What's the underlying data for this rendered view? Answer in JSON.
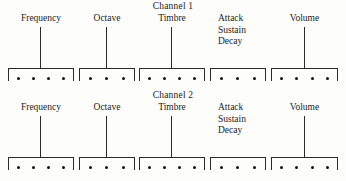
{
  "figure": {
    "background_color": "#fdfdfc",
    "ink_color": "#1c1c1c"
  },
  "channels": [
    {
      "title": "Channel 1",
      "groups": [
        {
          "label": "Frequency",
          "label_lines": [
            "Frequency"
          ],
          "dots": 4,
          "has_stem": true,
          "left": 8,
          "width": 66
        },
        {
          "label": "Octave",
          "label_lines": [
            "Octave"
          ],
          "dots": 3,
          "has_stem": true,
          "left": 79,
          "width": 56
        },
        {
          "label": "Timbre",
          "label_lines": [
            "Timbre"
          ],
          "dots": 4,
          "has_stem": true,
          "left": 139,
          "width": 66
        },
        {
          "label": "Attack Sustain Decay",
          "label_lines": [
            "Attack",
            "Sustain",
            "Decay"
          ],
          "dots": 3,
          "has_stem": false,
          "left": 210,
          "width": 56
        },
        {
          "label": "Volume",
          "label_lines": [
            "Volume"
          ],
          "dots": 4,
          "has_stem": true,
          "left": 271,
          "width": 67
        }
      ]
    },
    {
      "title": "Channel 2",
      "groups": [
        {
          "label": "Frequency",
          "label_lines": [
            "Frequency"
          ],
          "dots": 4,
          "has_stem": true,
          "left": 8,
          "width": 66
        },
        {
          "label": "Octave",
          "label_lines": [
            "Octave"
          ],
          "dots": 3,
          "has_stem": true,
          "left": 79,
          "width": 56
        },
        {
          "label": "Timbre",
          "label_lines": [
            "Timbre"
          ],
          "dots": 4,
          "has_stem": true,
          "left": 139,
          "width": 66
        },
        {
          "label": "Attack Sustain Decay",
          "label_lines": [
            "Attack",
            "Sustain",
            "Decay"
          ],
          "dots": 3,
          "has_stem": false,
          "left": 210,
          "width": 56
        },
        {
          "label": "Volume",
          "label_lines": [
            "Volume"
          ],
          "dots": 4,
          "has_stem": true,
          "left": 271,
          "width": 67
        }
      ]
    }
  ]
}
